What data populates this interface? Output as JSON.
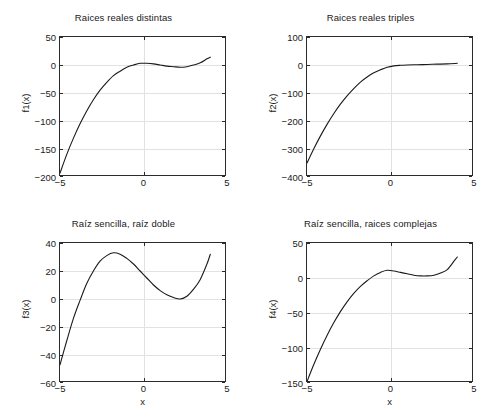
{
  "figure": {
    "background_color": "#ffffff",
    "axes_color": "#2b2b2b",
    "grid_color": "#e2e2e2",
    "curve_color": "#1a1a1a",
    "layout": "2x2 subplot grid"
  },
  "chart_data": [
    {
      "type": "line",
      "id": "f1",
      "title": "Raices reales distintas",
      "xlabel": "",
      "ylabel": "f1(x)",
      "xlim": [
        -5,
        5
      ],
      "ylim": [
        -200,
        50
      ],
      "xticks": [
        -5,
        0,
        5
      ],
      "xticklabels": [
        "-5",
        "0",
        "5"
      ],
      "yticks": [
        50,
        0,
        -50,
        -100,
        -150,
        -200
      ],
      "yticklabels": [
        "50",
        "0",
        "-50",
        "-100",
        "-150",
        "-200"
      ],
      "grid": true,
      "legend": null,
      "x": [
        -5,
        -4.6,
        -4.2,
        -3.8,
        -3.4,
        -3,
        -2.6,
        -2.2,
        -1.8,
        -1.4,
        -1,
        -0.6,
        -0.2,
        0.2,
        0.6,
        1,
        1.4,
        1.8,
        2.2,
        2.6,
        3,
        3.4,
        3.8,
        4
      ],
      "y": [
        -193,
        -160,
        -131,
        -105,
        -82,
        -62,
        -45,
        -31,
        -19,
        -11,
        -4,
        0,
        3,
        3,
        2,
        0,
        -2,
        -3,
        -4,
        -3,
        0,
        4,
        11,
        14
      ]
    },
    {
      "type": "line",
      "id": "f2",
      "title": "Raices reales triples",
      "xlabel": "",
      "ylabel": "f2(x)",
      "xlim": [
        -5,
        5
      ],
      "ylim": [
        -400,
        100
      ],
      "xticks": [
        -5,
        0,
        5
      ],
      "xticklabels": [
        "-5",
        "0",
        "5"
      ],
      "yticks": [
        100,
        0,
        -100,
        -200,
        -300,
        -400
      ],
      "yticklabels": [
        "100",
        "0",
        "-100",
        "-200",
        "-300",
        "-400"
      ],
      "grid": true,
      "legend": null,
      "x": [
        -5,
        -4.6,
        -4.2,
        -3.8,
        -3.4,
        -3,
        -2.6,
        -2.2,
        -1.8,
        -1.4,
        -1,
        -0.6,
        -0.2,
        0.2,
        0.6,
        1,
        1.6,
        2.2,
        2.8,
        3.4,
        4
      ],
      "y": [
        -350,
        -300,
        -254,
        -212,
        -174,
        -140,
        -110,
        -84,
        -61,
        -43,
        -28,
        -17,
        -8,
        -3,
        -1,
        0,
        1,
        2,
        3,
        4,
        6
      ]
    },
    {
      "type": "line",
      "id": "f3",
      "title": "Raíz sencilla, raíz doble",
      "xlabel": "x",
      "ylabel": "f3(x)",
      "xlim": [
        -5,
        5
      ],
      "ylim": [
        -60,
        40
      ],
      "xticks": [
        -5,
        0,
        5
      ],
      "xticklabels": [
        "-5",
        "0",
        "5"
      ],
      "yticks": [
        40,
        20,
        0,
        -20,
        -40,
        -60
      ],
      "yticklabels": [
        "40",
        "20",
        "0",
        "-20",
        "-40",
        "-60"
      ],
      "grid": true,
      "legend": null,
      "x": [
        -5,
        -4.6,
        -4.2,
        -3.8,
        -3.4,
        -3,
        -2.6,
        -2.2,
        -1.8,
        -1.4,
        -1,
        -0.6,
        -0.2,
        0.2,
        0.6,
        1,
        1.4,
        1.8,
        2.2,
        2.6,
        3,
        3.4,
        3.8,
        4
      ],
      "y": [
        -47,
        -30,
        -14,
        -1,
        11,
        20,
        27,
        31,
        33,
        32,
        29,
        25,
        20,
        15,
        10,
        6,
        3,
        1,
        0,
        2,
        7,
        14,
        25,
        32
      ]
    },
    {
      "type": "line",
      "id": "f4",
      "title": "Raíz sencilla, raices complejas",
      "xlabel": "x",
      "ylabel": "f4(x)",
      "xlim": [
        -5,
        5
      ],
      "ylim": [
        -150,
        50
      ],
      "xticks": [
        -5,
        0,
        5
      ],
      "xticklabels": [
        "-5",
        "0",
        "5"
      ],
      "yticks": [
        50,
        0,
        -50,
        -100,
        -150
      ],
      "yticklabels": [
        "50",
        "0",
        "-50",
        "-100",
        "-150"
      ],
      "grid": true,
      "legend": null,
      "x": [
        -5,
        -4.6,
        -4.2,
        -3.8,
        -3.4,
        -3,
        -2.6,
        -2.2,
        -1.8,
        -1.4,
        -1,
        -0.6,
        -0.2,
        0.2,
        0.6,
        1,
        1.4,
        1.8,
        2.2,
        2.6,
        3,
        3.4,
        3.8,
        4
      ],
      "y": [
        -148,
        -124,
        -102,
        -82,
        -64,
        -48,
        -34,
        -22,
        -12,
        -4,
        3,
        8,
        11,
        10,
        8,
        6,
        4,
        3,
        3,
        4,
        7,
        12,
        24,
        30
      ]
    }
  ]
}
